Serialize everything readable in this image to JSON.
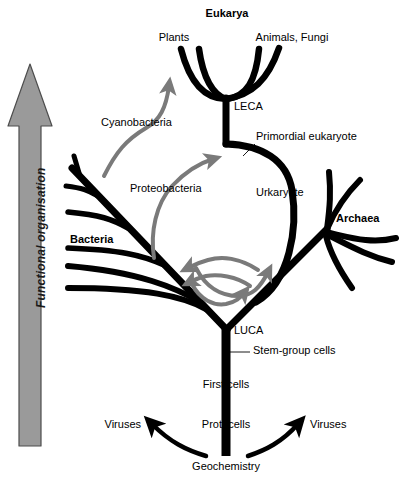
{
  "figure": {
    "background_color": "#ffffff",
    "line_color": "#000000",
    "hgt_arrow_color": "#7a7a7a",
    "axis_arrow_fill": "#9a9a9a",
    "axis_arrow_stroke": "#4d4d4d"
  },
  "axis": {
    "label": "Functional organisation",
    "direction": "upward"
  },
  "domains": {
    "eukarya": "Eukarya",
    "bacteria": "Bacteria",
    "archaea": "Archaea"
  },
  "tips": {
    "plants": "Plants",
    "animals_fungi": "Animals, Fungi"
  },
  "nodes": {
    "leca": "LECA",
    "luca": "LUCA",
    "primordial_eukaryote": "Primordial eukaryote",
    "urkaryote": "Urkaryote",
    "stem_group_cells": "Stem-group cells",
    "first_cells": "First cells",
    "protocells": "Protocells",
    "geochemistry": "Geochemistry"
  },
  "endosymbionts": {
    "cyanobacteria": "Cyanobacteria",
    "proteobacteria": "Proteobacteria"
  },
  "viruses": {
    "left": "Viruses",
    "right": "Viruses"
  },
  "diagram_data": {
    "type": "diagram",
    "subtype": "phylogenetic-tree",
    "root": "Geochemistry",
    "vertical_axis": "Functional organisation (increasing upward)",
    "lineage_order": [
      "Geochemistry",
      "Protocells",
      "First cells",
      "Stem-group cells",
      "LUCA"
    ],
    "branches_from_luca": [
      "Bacteria",
      "Archaea",
      "Urkaryote"
    ],
    "urkaryote_path": [
      "Urkaryote",
      "Primordial eukaryote",
      "LECA"
    ],
    "leca_descendants": [
      "Plants",
      "Animals, Fungi"
    ],
    "horizontal_gene_transfer_arrows": 4,
    "endosymbiosis_events": [
      {
        "donor": "Cyanobacteria",
        "recipient": "Plants"
      },
      {
        "donor": "Proteobacteria",
        "recipient": "Primordial eukaryote"
      }
    ],
    "virus_origins": [
      {
        "from": "Geochemistry",
        "to": "Viruses",
        "side": "left"
      },
      {
        "from": "Geochemistry",
        "to": "Viruses",
        "side": "right"
      }
    ]
  }
}
